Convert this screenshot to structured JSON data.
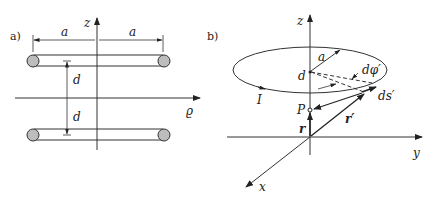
{
  "panel_a": {
    "label": "a)",
    "axes": {
      "vertical": "z",
      "horizontal": "ϱ"
    },
    "dimension_labels": {
      "left_radius": "a",
      "right_radius": "a",
      "upper_gap": "d",
      "lower_gap": "d"
    },
    "description": "Two coaxial rings of radius a at heights +d and −d (cross-section view)"
  },
  "panel_b": {
    "label": "b)",
    "axes": {
      "z": "z",
      "y": "y",
      "x": "x"
    },
    "labels": {
      "radius": "a",
      "height": "d",
      "angle": "dφ′",
      "element": "ds′",
      "current": "I",
      "point": "P",
      "position_vector": "r",
      "source_vector": "r′"
    },
    "description": "Single ring of radius a at height d carrying current I; field point P on axis"
  }
}
